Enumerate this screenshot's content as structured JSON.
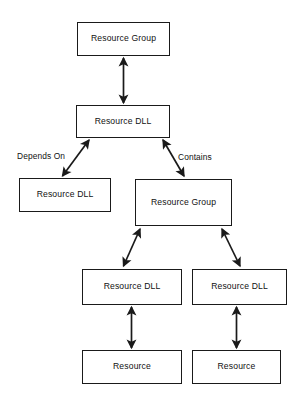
{
  "diagram": {
    "colors": {
      "background": "#ffffff",
      "stroke": "#1a1a1a",
      "text": "#111111"
    },
    "nodes": [
      {
        "id": "root-group",
        "label": "Resource Group",
        "shape": "rectangle"
      },
      {
        "id": "root-dll",
        "label": "Resource DLL",
        "shape": "rectangle"
      },
      {
        "id": "dep-dll",
        "label": "Resource DLL",
        "shape": "rectangle"
      },
      {
        "id": "child-group",
        "label": "Resource Group",
        "shape": "rectangle"
      },
      {
        "id": "left-dll",
        "label": "Resource DLL",
        "shape": "rectangle"
      },
      {
        "id": "right-dll",
        "label": "Resource DLL",
        "shape": "rectangle"
      },
      {
        "id": "left-res",
        "label": "Resource",
        "shape": "rectangle"
      },
      {
        "id": "right-res",
        "label": "Resource",
        "shape": "rectangle"
      }
    ],
    "edges": [
      {
        "id": "root-group-to-root-dll",
        "from": "root-group",
        "to": "root-dll",
        "label": "",
        "style": "double-arrow-vertical"
      },
      {
        "id": "root-dll-to-dep-dll",
        "from": "root-dll",
        "to": "dep-dll",
        "label": "Depends On",
        "style": "double-arrow-diagonal"
      },
      {
        "id": "root-dll-to-child-group",
        "from": "root-dll",
        "to": "child-group",
        "label": "Contains",
        "style": "double-arrow-diagonal"
      },
      {
        "id": "child-group-to-left-dll",
        "from": "child-group",
        "to": "left-dll",
        "label": "",
        "style": "double-arrow-diagonal"
      },
      {
        "id": "child-group-to-right-dll",
        "from": "child-group",
        "to": "right-dll",
        "label": "",
        "style": "double-arrow-diagonal"
      },
      {
        "id": "left-dll-to-left-res",
        "from": "left-dll",
        "to": "left-res",
        "label": "",
        "style": "double-arrow-vertical"
      },
      {
        "id": "right-dll-to-right-res",
        "from": "right-dll",
        "to": "right-res",
        "label": "",
        "style": "double-arrow-vertical"
      }
    ],
    "edge_labels": {
      "depends_on": "Depends On",
      "contains": "Contains"
    }
  }
}
